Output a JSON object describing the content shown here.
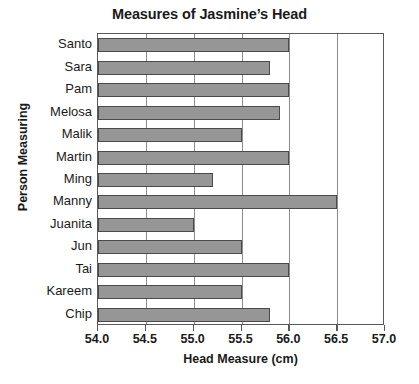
{
  "chart_data": {
    "type": "bar",
    "orientation": "horizontal",
    "title": "Measures of Jasmine’s Head",
    "xlabel": "Head Measure (cm)",
    "ylabel": "Person Measuring",
    "categories": [
      "Santo",
      "Sara",
      "Pam",
      "Melosa",
      "Malik",
      "Martin",
      "Ming",
      "Manny",
      "Juanita",
      "Jun",
      "Tai",
      "Kareem",
      "Chip"
    ],
    "values": [
      56.0,
      55.8,
      56.0,
      55.9,
      55.5,
      56.0,
      55.2,
      56.5,
      55.0,
      55.5,
      56.0,
      55.5,
      55.8
    ],
    "xlim": [
      54.0,
      57.0
    ],
    "xticks": [
      54.0,
      54.5,
      55.0,
      55.5,
      56.0,
      56.5,
      57.0
    ],
    "xtick_labels": [
      "54.0",
      "54.5",
      "55.0",
      "55.5",
      "56.0",
      "56.5",
      "57.0"
    ],
    "grid": "vertical",
    "legend": null,
    "bar_color": "#969696",
    "bar_edge_color": "#4a4a4a",
    "gridline_color": "#8c8c8c",
    "axis_color": "#5a5a5a"
  }
}
